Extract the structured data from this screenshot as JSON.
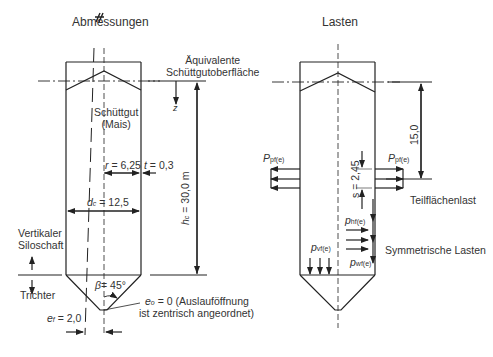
{
  "left_panel": {
    "title": "Abmessungen",
    "equivalent_surface": [
      "Äquivalente",
      "Schüttgutoberfläche"
    ],
    "z_label": "z",
    "material": [
      "Schüttgut",
      "(Mais)"
    ],
    "radius": {
      "sym": "r",
      "text": " = 6,25"
    },
    "wall_thickness": {
      "sym": "t",
      "text": " = 0,3"
    },
    "diameter": {
      "sym": "d",
      "sub": "c",
      "text": " = 12,5"
    },
    "height": {
      "sym": "h",
      "sub": "c",
      "text": " = 30,0 m"
    },
    "shaft_label": [
      "Vertikaler",
      "Siloschaft"
    ],
    "hopper_label": "Trichter",
    "hopper_angle": {
      "sym": "β",
      "text": "= 45°"
    },
    "outlet_eccentricity": {
      "sym": "e",
      "sub": "o",
      "text": " = 0 (Auslauföffnung",
      "line2": "ist zentrisch angeordnet)"
    },
    "fill_eccentricity": {
      "sym": "e",
      "sub": "f",
      "text": " = 2,0"
    }
  },
  "right_panel": {
    "title": "Lasten",
    "depth": "15,0",
    "patch_height": {
      "sym": "s",
      "text": " = 2,45"
    },
    "patch_load_left": {
      "sym": "P",
      "sub": "pf(e)"
    },
    "patch_load_right": {
      "sym": "P",
      "sub": "pf(e)"
    },
    "patch_label": "Teilflächenlast",
    "horizontal_pressure": {
      "sym": "p",
      "sub": "hf(e)"
    },
    "vertical_pressure": {
      "sym": "p",
      "sub": "vf(e)"
    },
    "wall_friction": {
      "sym": "p",
      "sub": "wf(e)"
    },
    "symmetric_label": "Symmetrische Lasten"
  },
  "colors": {
    "line": "#222222",
    "text": "#333333",
    "background": "#ffffff"
  }
}
